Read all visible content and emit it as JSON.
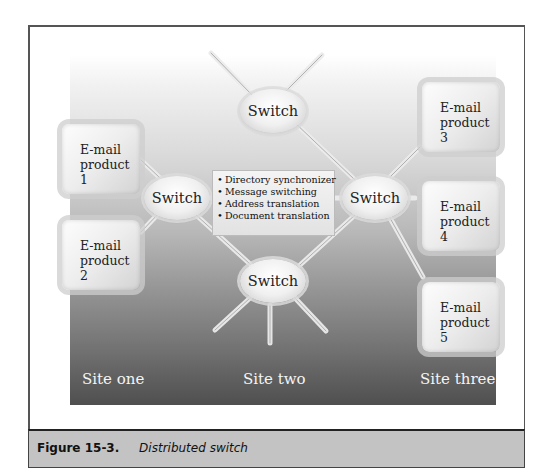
{
  "diagram": {
    "title": "Distributed switch",
    "switches": [
      {
        "id": "top",
        "label": "Switch"
      },
      {
        "id": "left",
        "label": "Switch"
      },
      {
        "id": "right",
        "label": "Switch"
      },
      {
        "id": "bottom",
        "label": "Switch"
      }
    ],
    "products": [
      {
        "line1": "E-mail",
        "line2": "product 1"
      },
      {
        "line1": "E-mail",
        "line2": "product 2"
      },
      {
        "line1": "E-mail",
        "line2": "product 3"
      },
      {
        "line1": "E-mail",
        "line2": "product 4"
      },
      {
        "line1": "E-mail",
        "line2": "product 5"
      }
    ],
    "features": [
      "Directory synchronizer",
      "Message switching",
      "Address translation",
      "Document translation"
    ],
    "sites": [
      "Site one",
      "Site two",
      "Site three"
    ],
    "colors": {
      "background_top": "#ffffff",
      "background_bottom": "#555555",
      "caption_bar": "#c3c3c3"
    }
  },
  "caption": {
    "figure_number": "Figure 15-3.",
    "figure_title": "Distributed switch"
  }
}
